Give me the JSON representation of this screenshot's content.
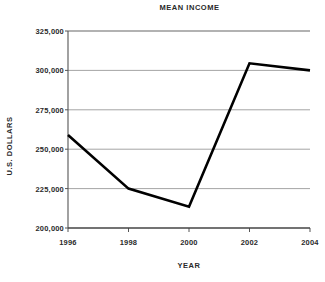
{
  "chart_data": {
    "type": "line",
    "title": "MEAN INCOME",
    "xlabel": "YEAR",
    "ylabel": "U.S. DOLLARS",
    "x": [
      1996,
      1998,
      2000,
      2002,
      2004
    ],
    "categories": [
      "1996",
      "1998",
      "2000",
      "2002",
      "2004"
    ],
    "values": [
      259000,
      225000,
      213500,
      304500,
      300000
    ],
    "series": [
      {
        "name": "Mean income",
        "values": [
          259000,
          225000,
          213500,
          304500,
          300000
        ]
      }
    ],
    "xlim": [
      1996,
      2004
    ],
    "ylim": [
      200000,
      325000
    ],
    "ytick_values": [
      325000,
      300000,
      275000,
      250000,
      225000,
      200000
    ],
    "ytick_labels": [
      "325,000",
      "300,000",
      "275,000",
      "250,000",
      "225,000",
      "200,000"
    ],
    "xtick_labels": [
      "1996",
      "1998",
      "2000",
      "2002",
      "2004"
    ],
    "grid": "horizontal",
    "legend": "none",
    "line_color": "#000000",
    "grid_color": "#9a9a9a",
    "axis_color": "#555555",
    "background_color": "#ffffff"
  }
}
